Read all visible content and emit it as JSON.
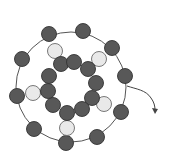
{
  "diagram": {
    "width": 169,
    "height": 162,
    "colors": {
      "background": "#ffffff",
      "ring_stroke": "#555555",
      "dark_fill": "#585858",
      "dark_stroke": "#333333",
      "light_fill": "#e9e9e9",
      "light_stroke": "#6a6a6a",
      "arrow": "#444444"
    },
    "orbit": {
      "cx": 71,
      "cy": 87,
      "r": 55
    },
    "node_radius": 7.5,
    "outer_ring_dark": [
      {
        "x": 49,
        "y": 34
      },
      {
        "x": 83,
        "y": 31
      },
      {
        "x": 112,
        "y": 48
      },
      {
        "x": 125,
        "y": 76
      },
      {
        "x": 121,
        "y": 112
      },
      {
        "x": 97,
        "y": 137
      },
      {
        "x": 66,
        "y": 143
      },
      {
        "x": 34,
        "y": 129
      },
      {
        "x": 17,
        "y": 96
      },
      {
        "x": 22,
        "y": 59
      }
    ],
    "light_nodes": [
      {
        "x": 55,
        "y": 51
      },
      {
        "x": 99,
        "y": 59
      },
      {
        "x": 33,
        "y": 93
      },
      {
        "x": 104,
        "y": 104
      },
      {
        "x": 67,
        "y": 128
      }
    ],
    "inner_ring_dark": [
      {
        "x": 61,
        "y": 64
      },
      {
        "x": 74,
        "y": 62
      },
      {
        "x": 88,
        "y": 69
      },
      {
        "x": 96,
        "y": 83
      },
      {
        "x": 92,
        "y": 98
      },
      {
        "x": 82,
        "y": 109
      },
      {
        "x": 67,
        "y": 113
      },
      {
        "x": 53,
        "y": 105
      },
      {
        "x": 48,
        "y": 91
      },
      {
        "x": 49,
        "y": 76
      }
    ],
    "arrow": {
      "path": "M127 86 C 136 89, 146 90, 151 98 C 154 102, 155 106, 155 110",
      "head": {
        "x": 155,
        "y": 114
      }
    }
  }
}
